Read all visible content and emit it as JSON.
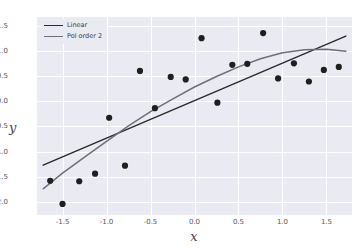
{
  "chart_data": {
    "type": "scatter",
    "title": "",
    "xlabel": "x",
    "ylabel": "y",
    "xlim": [
      -1.79,
      1.79
    ],
    "ylim": [
      -2.26,
      1.67
    ],
    "grid": true,
    "legend_position": "upper left",
    "xticks": [
      -1.5,
      -1.0,
      -0.5,
      0.0,
      0.5,
      1.0,
      1.5
    ],
    "xtick_labels": [
      "-1.5",
      "-1.0",
      "-0.5",
      "0.0",
      "0.5",
      "1.0",
      "1.5"
    ],
    "yticks": [
      -2.0,
      -1.5,
      -1.0,
      -0.5,
      0.0,
      0.5,
      1.0,
      1.5
    ],
    "ytick_labels": [
      "-2.0",
      "-1.5",
      "-1.0",
      "-0.5",
      "0.0",
      "0.5",
      "1.0",
      "1.5"
    ],
    "scatter": {
      "name": "observations",
      "marker": "circle",
      "color": "#1f1f1f",
      "x": [
        -1.64,
        -1.5,
        -1.31,
        -1.13,
        -0.97,
        -0.79,
        -0.62,
        -0.45,
        -0.27,
        -0.1,
        0.08,
        0.26,
        0.43,
        0.6,
        0.78,
        0.95,
        1.13,
        1.3,
        1.47,
        1.64
      ],
      "y": [
        -1.58,
        -2.04,
        -1.59,
        -1.44,
        -0.33,
        -1.28,
        0.6,
        -0.14,
        0.48,
        0.43,
        1.25,
        -0.03,
        0.72,
        0.74,
        1.35,
        0.45,
        0.75,
        0.39,
        0.62,
        0.68
      ]
    },
    "series": [
      {
        "name": "Linear",
        "type": "line",
        "color": "#2b2b30",
        "x": [
          -1.72,
          1.72
        ],
        "y": [
          -1.27,
          1.29
        ]
      },
      {
        "name": "Pol order 2",
        "type": "line",
        "color": "#6f6f78",
        "coefficients": {
          "a": -0.255,
          "b": 0.608,
          "c": 0.055
        },
        "x": [
          -1.72,
          -1.5,
          -1.25,
          -1.0,
          -0.75,
          -0.5,
          -0.25,
          0.0,
          0.25,
          0.5,
          0.75,
          1.0,
          1.25,
          1.5,
          1.72
        ],
        "y": [
          -1.74,
          -1.43,
          -1.11,
          -0.8,
          -0.49,
          -0.21,
          0.04,
          0.28,
          0.49,
          0.68,
          0.84,
          0.96,
          1.02,
          1.03,
          0.99
        ]
      }
    ]
  },
  "legend": {
    "items": [
      {
        "label": "Linear",
        "color": "#2b2b30"
      },
      {
        "label": "Pol order 2",
        "color": "#6f6f78"
      }
    ]
  }
}
